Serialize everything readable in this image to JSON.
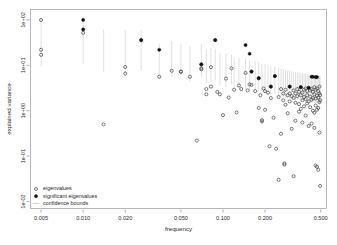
{
  "chart_data": {
    "type": "scatter",
    "title": "",
    "xlabel": "frequency",
    "ylabel": "explained variance",
    "xscale": "log",
    "yscale": "log",
    "xlim": [
      0.0042,
      0.55
    ],
    "ylim": [
      0.007,
      170
    ],
    "grid": false,
    "xticks": [
      0.005,
      0.01,
      0.02,
      0.05,
      0.1,
      0.2,
      0.5
    ],
    "xticklabels": [
      "0.005",
      "0.010",
      "0.020",
      "0.050",
      "0.100",
      "0.200",
      "0.500"
    ],
    "yticks": [
      100,
      10,
      1,
      0.1,
      0.01
    ],
    "yticklabels": [
      "1e+02",
      "1e+01",
      "1e+00",
      "1e-01",
      "1e-02"
    ],
    "legend": {
      "position": "bottom-left",
      "entries": [
        {
          "label": "eigenvalues",
          "marker": "open-circle",
          "color": "#4d4d4d"
        },
        {
          "label": "significant eigenvalues",
          "marker": "filled-circle",
          "color": "#121212"
        },
        {
          "label": "confidence bounds",
          "marker": "line",
          "color": "#c2c2c2"
        }
      ]
    },
    "series": [
      {
        "name": "eigenvalues",
        "marker": "open-circle",
        "points": [
          [
            0.005,
            100.0
          ],
          [
            0.005,
            22.0
          ],
          [
            0.005,
            17.0
          ],
          [
            0.01,
            52.0
          ],
          [
            0.014,
            0.5
          ],
          [
            0.02,
            9.2
          ],
          [
            0.02,
            6.6
          ],
          [
            0.026,
            36.0
          ],
          [
            0.035,
            5.6
          ],
          [
            0.043,
            7.6
          ],
          [
            0.05,
            7.3
          ],
          [
            0.05,
            7.2
          ],
          [
            0.058,
            5.6
          ],
          [
            0.065,
            0.22
          ],
          [
            0.07,
            10.5
          ],
          [
            0.07,
            8.6
          ],
          [
            0.07,
            8.2
          ],
          [
            0.076,
            3.0
          ],
          [
            0.076,
            2.3
          ],
          [
            0.082,
            3.4
          ],
          [
            0.082,
            9.1
          ],
          [
            0.088,
            36.0
          ],
          [
            0.091,
            2.6
          ],
          [
            0.095,
            2.3
          ],
          [
            0.1,
            0.8
          ],
          [
            0.105,
            5.1
          ],
          [
            0.11,
            1.95
          ],
          [
            0.115,
            8.6
          ],
          [
            0.12,
            2.9
          ],
          [
            0.125,
            0.92
          ],
          [
            0.13,
            3.6
          ],
          [
            0.135,
            3.0
          ],
          [
            0.145,
            6.8
          ],
          [
            0.15,
            2.8
          ],
          [
            0.155,
            3.8
          ],
          [
            0.16,
            3.7
          ],
          [
            0.16,
            7.3
          ],
          [
            0.17,
            2.7
          ],
          [
            0.18,
            5.2
          ],
          [
            0.18,
            1.15
          ],
          [
            0.185,
            2.2
          ],
          [
            0.19,
            0.62
          ],
          [
            0.19,
            0.58
          ],
          [
            0.195,
            3.1
          ],
          [
            0.2,
            1.05
          ],
          [
            0.2,
            2.7
          ],
          [
            0.21,
            2.5
          ],
          [
            0.215,
            0.165
          ],
          [
            0.22,
            3.4
          ],
          [
            0.22,
            1.9
          ],
          [
            0.23,
            0.7
          ],
          [
            0.235,
            5.8
          ],
          [
            0.24,
            0.145
          ],
          [
            0.25,
            2.0
          ],
          [
            0.25,
            0.03
          ],
          [
            0.26,
            3.0
          ],
          [
            0.26,
            0.31
          ],
          [
            0.27,
            1.7
          ],
          [
            0.27,
            2.4
          ],
          [
            0.275,
            0.069
          ],
          [
            0.275,
            0.065
          ],
          [
            0.28,
            2.9
          ],
          [
            0.28,
            1.35
          ],
          [
            0.29,
            2.2
          ],
          [
            0.29,
            0.88
          ],
          [
            0.3,
            3.4
          ],
          [
            0.3,
            2.4
          ],
          [
            0.3,
            1.6
          ],
          [
            0.31,
            2.1
          ],
          [
            0.31,
            0.4
          ],
          [
            0.32,
            2.8
          ],
          [
            0.32,
            1.9
          ],
          [
            0.32,
            0.036
          ],
          [
            0.33,
            2.4
          ],
          [
            0.33,
            1.5
          ],
          [
            0.33,
            0.6
          ],
          [
            0.34,
            3.0
          ],
          [
            0.34,
            2.1
          ],
          [
            0.35,
            2.6
          ],
          [
            0.35,
            1.4
          ],
          [
            0.35,
            0.95
          ],
          [
            0.36,
            3.3
          ],
          [
            0.36,
            2.2
          ],
          [
            0.36,
            1.1
          ],
          [
            0.37,
            2.5
          ],
          [
            0.37,
            1.7
          ],
          [
            0.37,
            0.55
          ],
          [
            0.38,
            2.9
          ],
          [
            0.38,
            2.0
          ],
          [
            0.38,
            1.25
          ],
          [
            0.39,
            3.1
          ],
          [
            0.39,
            1.8
          ],
          [
            0.39,
            0.78
          ],
          [
            0.4,
            2.7
          ],
          [
            0.4,
            2.2
          ],
          [
            0.4,
            1.45
          ],
          [
            0.41,
            3.2
          ],
          [
            0.41,
            1.6
          ],
          [
            0.41,
            0.46
          ],
          [
            0.42,
            2.8
          ],
          [
            0.42,
            2.05
          ],
          [
            0.42,
            1.2
          ],
          [
            0.43,
            3.0
          ],
          [
            0.43,
            1.75
          ],
          [
            0.43,
            0.52
          ],
          [
            0.44,
            2.6
          ],
          [
            0.44,
            1.9
          ],
          [
            0.44,
            1.0
          ],
          [
            0.45,
            3.3
          ],
          [
            0.45,
            2.3
          ],
          [
            0.45,
            0.9
          ],
          [
            0.45,
            0.42
          ],
          [
            0.46,
            2.9
          ],
          [
            0.46,
            1.85
          ],
          [
            0.46,
            1.3
          ],
          [
            0.46,
            0.062
          ],
          [
            0.47,
            3.1
          ],
          [
            0.47,
            2.15
          ],
          [
            0.47,
            1.05
          ],
          [
            0.47,
            0.058
          ],
          [
            0.48,
            2.7
          ],
          [
            0.48,
            1.95
          ],
          [
            0.48,
            1.15
          ],
          [
            0.48,
            0.05
          ],
          [
            0.49,
            3.4
          ],
          [
            0.49,
            2.4
          ],
          [
            0.49,
            1.55
          ],
          [
            0.49,
            0.33
          ],
          [
            0.495,
            2.2
          ],
          [
            0.495,
            1.7
          ],
          [
            0.495,
            0.022
          ]
        ]
      },
      {
        "name": "significant eigenvalues",
        "marker": "filled-circle",
        "points": [
          [
            0.01,
            100.0
          ],
          [
            0.01,
            62.0
          ],
          [
            0.026,
            36.0
          ],
          [
            0.035,
            22.0
          ],
          [
            0.07,
            10.5
          ],
          [
            0.088,
            36.0
          ],
          [
            0.145,
            28.0
          ],
          [
            0.155,
            18.0
          ],
          [
            0.16,
            7.3
          ],
          [
            0.18,
            5.2
          ],
          [
            0.22,
            3.4
          ],
          [
            0.235,
            5.8
          ],
          [
            0.3,
            3.4
          ],
          [
            0.43,
            5.6
          ],
          [
            0.44,
            5.6
          ],
          [
            0.46,
            5.5
          ],
          [
            0.47,
            5.5
          ],
          [
            0.36,
            3.3
          ],
          [
            0.41,
            3.2
          ]
        ]
      }
    ],
    "confidence_bounds": [
      [
        0.005,
        9.5,
        110.0
      ],
      [
        0.01,
        10.5,
        120.0
      ],
      [
        0.014,
        7.0,
        62.0
      ],
      [
        0.02,
        6.4,
        60.0
      ],
      [
        0.026,
        7.5,
        58.0
      ],
      [
        0.035,
        5.2,
        30.0
      ],
      [
        0.043,
        5.6,
        34.0
      ],
      [
        0.05,
        6.0,
        29.0
      ],
      [
        0.058,
        4.4,
        26.0
      ],
      [
        0.07,
        5.6,
        30.0
      ],
      [
        0.076,
        4.0,
        22.0
      ],
      [
        0.082,
        4.2,
        24.0
      ],
      [
        0.088,
        4.6,
        23.0
      ],
      [
        0.095,
        3.6,
        19.0
      ],
      [
        0.105,
        3.4,
        18.0
      ],
      [
        0.115,
        3.8,
        17.0
      ],
      [
        0.12,
        3.1,
        15.0
      ],
      [
        0.13,
        3.2,
        14.5
      ],
      [
        0.145,
        3.0,
        14.0
      ],
      [
        0.155,
        2.8,
        13.0
      ],
      [
        0.17,
        2.9,
        12.5
      ],
      [
        0.18,
        2.6,
        12.0
      ],
      [
        0.19,
        2.5,
        11.0
      ],
      [
        0.2,
        2.4,
        10.5
      ],
      [
        0.21,
        2.3,
        10.0
      ],
      [
        0.22,
        2.2,
        9.6
      ],
      [
        0.235,
        2.4,
        9.2
      ],
      [
        0.25,
        2.1,
        8.8
      ],
      [
        0.26,
        2.0,
        8.4
      ],
      [
        0.27,
        2.0,
        8.2
      ],
      [
        0.28,
        1.9,
        8.0
      ],
      [
        0.29,
        1.9,
        7.8
      ],
      [
        0.3,
        1.85,
        7.6
      ],
      [
        0.31,
        1.8,
        7.4
      ],
      [
        0.32,
        1.8,
        7.2
      ],
      [
        0.33,
        1.75,
        7.1
      ],
      [
        0.34,
        1.75,
        7.0
      ],
      [
        0.35,
        1.7,
        6.9
      ],
      [
        0.36,
        1.7,
        6.8
      ],
      [
        0.37,
        1.65,
        6.7
      ],
      [
        0.38,
        1.65,
        6.6
      ],
      [
        0.39,
        1.6,
        6.5
      ],
      [
        0.4,
        1.6,
        6.4
      ],
      [
        0.41,
        1.6,
        6.3
      ],
      [
        0.42,
        1.55,
        6.3
      ],
      [
        0.43,
        1.55,
        6.2
      ],
      [
        0.44,
        1.5,
        6.2
      ],
      [
        0.45,
        1.5,
        6.1
      ],
      [
        0.46,
        1.5,
        6.1
      ],
      [
        0.47,
        1.45,
        6.0
      ],
      [
        0.48,
        1.45,
        6.0
      ],
      [
        0.49,
        1.4,
        5.9
      ],
      [
        0.495,
        1.4,
        5.9
      ]
    ]
  }
}
